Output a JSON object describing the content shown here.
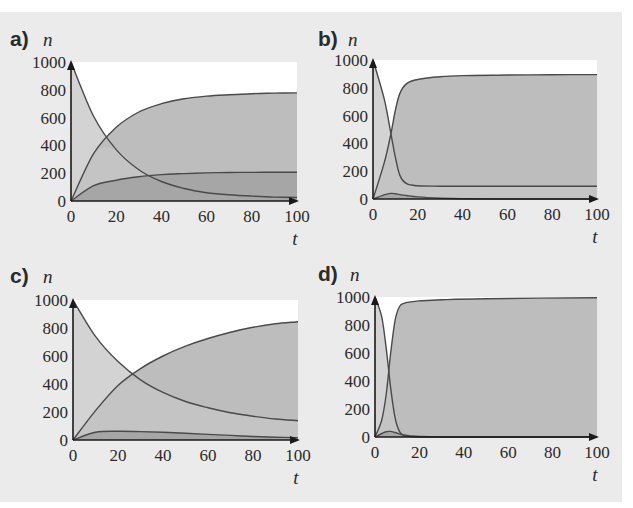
{
  "figure": {
    "background": "#ebebeb",
    "plot_background": "#ffffff",
    "colors": {
      "recovered_fill": "#bdbdbd",
      "susceptible_fill": "#d3d3d3",
      "infected_fill": "#a6a6a6",
      "curve": "#4a4a4a",
      "axis": "#1a1a1a"
    }
  },
  "chart_data": [
    {
      "panel": "a)",
      "type": "area",
      "ylabel": "n",
      "xlabel": "t",
      "xlim": [
        0,
        100
      ],
      "ylim": [
        0,
        1000
      ],
      "xticks": [
        0,
        20,
        40,
        60,
        80,
        100
      ],
      "yticks": [
        0,
        200,
        400,
        600,
        800,
        1000
      ],
      "x": [
        0,
        10,
        20,
        30,
        40,
        50,
        60,
        70,
        80,
        90,
        100
      ],
      "series": [
        {
          "name": "susceptible",
          "values": [
            1000,
            610,
            370,
            225,
            140,
            90,
            60,
            45,
            35,
            28,
            25
          ]
        },
        {
          "name": "recovered",
          "values": [
            0,
            340,
            530,
            640,
            700,
            735,
            755,
            765,
            772,
            776,
            778
          ]
        },
        {
          "name": "infected",
          "values": [
            0,
            110,
            150,
            175,
            190,
            197,
            202,
            205,
            206,
            207,
            207
          ]
        }
      ]
    },
    {
      "panel": "b)",
      "type": "area",
      "ylabel": "n",
      "xlabel": "t",
      "xlim": [
        0,
        100
      ],
      "ylim": [
        0,
        1000
      ],
      "xticks": [
        0,
        20,
        40,
        60,
        80,
        100
      ],
      "yticks": [
        0,
        200,
        400,
        600,
        800,
        1000
      ],
      "x": [
        0,
        5,
        8,
        10,
        12,
        15,
        20,
        30,
        40,
        60,
        80,
        100
      ],
      "series": [
        {
          "name": "susceptible",
          "values": [
            1000,
            720,
            470,
            300,
            170,
            110,
            95,
            92,
            92,
            92,
            92,
            92
          ]
        },
        {
          "name": "recovered",
          "values": [
            0,
            260,
            470,
            640,
            760,
            830,
            860,
            880,
            888,
            892,
            894,
            895
          ]
        },
        {
          "name": "infected",
          "values": [
            0,
            30,
            40,
            38,
            32,
            25,
            15,
            6,
            2,
            0,
            0,
            0
          ]
        }
      ]
    },
    {
      "panel": "c)",
      "type": "area",
      "ylabel": "n",
      "xlabel": "t",
      "xlim": [
        0,
        100
      ],
      "ylim": [
        0,
        1000
      ],
      "xticks": [
        0,
        20,
        40,
        60,
        80,
        100
      ],
      "yticks": [
        0,
        200,
        400,
        600,
        800,
        1000
      ],
      "x": [
        0,
        10,
        20,
        30,
        40,
        50,
        60,
        70,
        80,
        90,
        100
      ],
      "series": [
        {
          "name": "susceptible",
          "values": [
            1000,
            740,
            560,
            430,
            340,
            275,
            230,
            195,
            170,
            150,
            138
          ]
        },
        {
          "name": "recovered",
          "values": [
            0,
            210,
            390,
            510,
            600,
            670,
            725,
            770,
            805,
            830,
            845
          ]
        },
        {
          "name": "infected",
          "values": [
            0,
            55,
            62,
            60,
            55,
            48,
            40,
            33,
            25,
            20,
            17
          ]
        }
      ]
    },
    {
      "panel": "d)",
      "type": "area",
      "ylabel": "n",
      "xlabel": "t",
      "xlim": [
        0,
        100
      ],
      "ylim": [
        0,
        1000
      ],
      "xticks": [
        0,
        20,
        40,
        60,
        80,
        100
      ],
      "yticks": [
        0,
        200,
        400,
        600,
        800,
        1000
      ],
      "x": [
        0,
        3,
        5,
        7,
        9,
        11,
        13,
        16,
        20,
        30,
        50,
        100
      ],
      "series": [
        {
          "name": "susceptible",
          "values": [
            1000,
            860,
            640,
            360,
            140,
            40,
            10,
            3,
            0,
            0,
            0,
            0
          ]
        },
        {
          "name": "recovered",
          "values": [
            0,
            120,
            300,
            590,
            830,
            930,
            955,
            965,
            972,
            980,
            988,
            995
          ]
        },
        {
          "name": "infected",
          "values": [
            0,
            25,
            38,
            40,
            32,
            22,
            14,
            8,
            4,
            1,
            0,
            0
          ]
        }
      ]
    }
  ]
}
